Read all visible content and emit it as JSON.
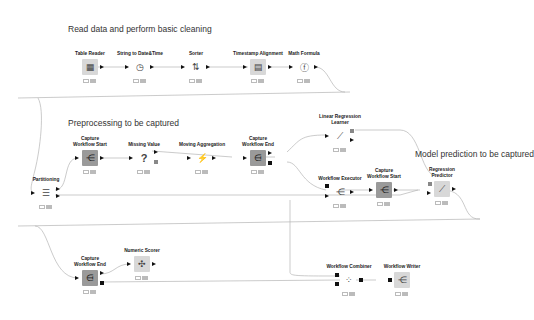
{
  "annotations": [
    {
      "id": "a1",
      "text": "Read data and perform basic cleaning"
    },
    {
      "id": "a2",
      "text": "Preprocessing to be captured"
    },
    {
      "id": "a3",
      "text": "Model prediction to be captured"
    },
    {
      "id": "a4",
      "text": "Combine preprocessing and prediction\nto create deployment workflow"
    }
  ],
  "nodes": {
    "table_reader": {
      "label": "Table Reader",
      "icon": "table-icon",
      "glyph": "▦"
    },
    "string_to_datetime": {
      "label": "String to Date&Time",
      "icon": "clock-icon",
      "glyph": "◷"
    },
    "sorter": {
      "label": "Sorter",
      "icon": "sort-icon",
      "glyph": "⇅"
    },
    "timestamp_alignment": {
      "label": "Timestamp Alignment",
      "icon": "calendar-icon",
      "glyph": "▤"
    },
    "math_formula": {
      "label": "Math Formula",
      "icon": "formula-icon",
      "glyph": "ⓕ"
    },
    "partitioning": {
      "label": "Partitioning",
      "icon": "partition-icon",
      "glyph": "☰"
    },
    "capture_start_1": {
      "label": "Capture\nWorkflow Start",
      "icon": "capture-start-icon",
      "glyph": "⋲"
    },
    "missing_value": {
      "label": "Missing Value",
      "icon": "question-icon",
      "glyph": "?"
    },
    "moving_aggregation": {
      "label": "Moving Aggregation",
      "icon": "aggregation-icon",
      "glyph": "⚡"
    },
    "capture_end_1": {
      "label": "Capture\nWorkflow End",
      "icon": "capture-end-icon",
      "glyph": "⋳"
    },
    "linear_regression_learner": {
      "label": "Linear Regression\nLearner",
      "icon": "regression-icon",
      "glyph": "⟋"
    },
    "workflow_executor": {
      "label": "Workflow Executor",
      "icon": "executor-icon",
      "glyph": "⋲"
    },
    "capture_start_2": {
      "label": "Capture\nWorkflow Start",
      "icon": "capture-start-icon",
      "glyph": "⋲"
    },
    "regression_predictor": {
      "label": "Regression\nPredictor",
      "icon": "predictor-icon",
      "glyph": "⟋"
    },
    "capture_end_2": {
      "label": "Capture\nWorkflow End",
      "icon": "capture-end-icon",
      "glyph": "⋳"
    },
    "numeric_scorer": {
      "label": "Numeric Scorer",
      "icon": "scorer-icon",
      "glyph": "✣"
    },
    "workflow_combiner": {
      "label": "Workflow Combiner",
      "icon": "combiner-icon",
      "glyph": "⁘"
    },
    "workflow_writer": {
      "label": "Workflow Writer",
      "icon": "writer-icon",
      "glyph": "⋲"
    }
  },
  "colors": {
    "canvas_bg": "#ffffff",
    "wire": "#b0b0b0",
    "node_gray": "#9a9a9a",
    "node_light": "#d8d8d8",
    "port": "#111111",
    "annotation_text": "#333333"
  }
}
